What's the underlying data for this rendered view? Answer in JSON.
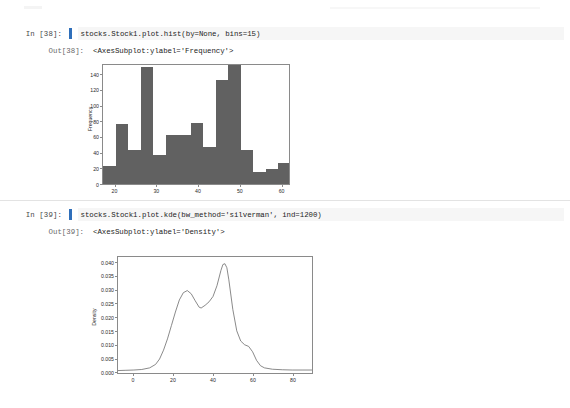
{
  "notebook": {
    "cells": [
      {
        "input_prompt": "In [38]:",
        "code": "stocks.Stock1.plot.hist(by=None, bins=15)",
        "output_prompt": "Out[38]:",
        "output_text": "<AxesSubplot:ylabel='Frequency'>"
      },
      {
        "input_prompt": "In [39]:",
        "code": "stocks.Stock1.plot.kde(bw_method='silverman', ind=1200)",
        "output_prompt": "Out[39]:",
        "output_text": "<AxesSubplot:ylabel='Density'>"
      }
    ],
    "cell_indicator_color": "#2f6fba",
    "code_background": "#f6f6f6"
  },
  "chart_data": [
    {
      "type": "bar",
      "title": "",
      "xlabel": "",
      "ylabel": "Frequency",
      "bins": 15,
      "xlim": [
        17.0,
        62.0
      ],
      "ylim": [
        0,
        152
      ],
      "xticks": [
        20,
        30,
        40,
        50,
        60
      ],
      "yticks": [
        0,
        20,
        40,
        60,
        80,
        100,
        120,
        140
      ],
      "bar_color": "#616161",
      "grid": false,
      "legend": false,
      "bin_edges": [
        17.0,
        20.0,
        23.0,
        26.0,
        29.0,
        32.0,
        35.0,
        38.0,
        41.0,
        44.0,
        47.0,
        50.0,
        53.0,
        56.0,
        59.0,
        62.0
      ],
      "categories": [
        "17-20",
        "20-23",
        "23-26",
        "26-29",
        "29-32",
        "32-35",
        "35-38",
        "38-41",
        "41-44",
        "44-47",
        "47-50",
        "50-53",
        "53-56",
        "56-59",
        "59-62"
      ],
      "values": [
        23,
        76,
        43,
        147,
        37,
        62,
        61,
        77,
        46,
        131,
        150,
        43,
        15,
        19,
        26
      ]
    },
    {
      "type": "line",
      "title": "",
      "xlabel": "",
      "ylabel": "Density",
      "xlim": [
        -8,
        90
      ],
      "ylim": [
        -0.001,
        0.0425
      ],
      "xticks": [
        0,
        20,
        40,
        60,
        80
      ],
      "yticks": [
        0.0,
        0.005,
        0.01,
        0.015,
        0.02,
        0.025,
        0.03,
        0.035,
        0.04
      ],
      "ytick_labels": [
        "0.000",
        "0.005",
        "0.010",
        "0.015",
        "0.020",
        "0.025",
        "0.030",
        "0.035",
        "0.040"
      ],
      "line_color": "#6b6b6b",
      "grid": false,
      "legend": false,
      "x": [
        -8,
        -4,
        0,
        4,
        8,
        11,
        13,
        15,
        17,
        19,
        21,
        23,
        25,
        27,
        29,
        31,
        33,
        34,
        36,
        38,
        40,
        42,
        44,
        45,
        46,
        47,
        48,
        50,
        52,
        54,
        56,
        58,
        60,
        62,
        64,
        66,
        70,
        75,
        80,
        85,
        90
      ],
      "y": [
        0.0002,
        0.0003,
        0.0004,
        0.0006,
        0.0012,
        0.0025,
        0.0045,
        0.0078,
        0.012,
        0.017,
        0.022,
        0.0265,
        0.0292,
        0.03,
        0.0288,
        0.0262,
        0.0238,
        0.0235,
        0.0245,
        0.0258,
        0.0278,
        0.0318,
        0.0375,
        0.0397,
        0.04,
        0.0385,
        0.034,
        0.023,
        0.015,
        0.0112,
        0.0098,
        0.0092,
        0.0072,
        0.004,
        0.002,
        0.0012,
        0.0007,
        0.0005,
        0.0004,
        0.0004,
        0.0004
      ]
    }
  ]
}
